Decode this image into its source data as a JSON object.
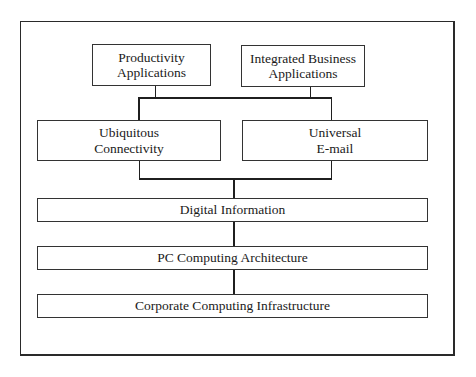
{
  "diagram": {
    "type": "layered-architecture",
    "layers": [
      {
        "name": "applications",
        "nodes": [
          {
            "id": "productivity",
            "line1": "Productivity",
            "line2": "Applications"
          },
          {
            "id": "integrated",
            "line1": "Integrated Business",
            "line2": "Applications"
          }
        ]
      },
      {
        "name": "connectivity",
        "nodes": [
          {
            "id": "ubiquitous",
            "line1": "Ubiquitous",
            "line2": "Connectivity"
          },
          {
            "id": "email",
            "line1": "Universal",
            "line2": "E-mail"
          }
        ]
      },
      {
        "name": "digital-information",
        "label": "Digital Information"
      },
      {
        "name": "pc-architecture",
        "label": "PC Computing Architecture"
      },
      {
        "name": "corporate-infrastructure",
        "label": "Corporate Computing Infrastructure"
      }
    ],
    "edges": [
      [
        "productivity",
        "connectivity-bus"
      ],
      [
        "integrated",
        "connectivity-bus"
      ],
      [
        "connectivity-bus",
        "ubiquitous"
      ],
      [
        "connectivity-bus",
        "email"
      ],
      [
        "ubiquitous",
        "digital-information"
      ],
      [
        "email",
        "digital-information"
      ],
      [
        "digital-information",
        "pc-architecture"
      ],
      [
        "pc-architecture",
        "corporate-infrastructure"
      ]
    ]
  }
}
